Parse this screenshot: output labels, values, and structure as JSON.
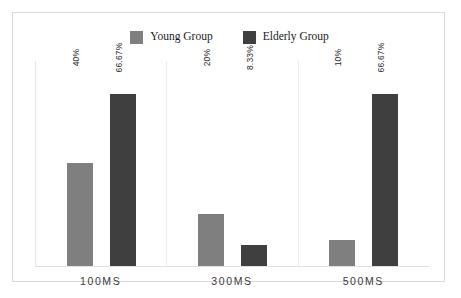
{
  "chart_data": {
    "type": "bar",
    "title": "",
    "subtitle": "",
    "xlabel": "",
    "ylabel": "",
    "categories": [
      "100MS",
      "300MS",
      "500MS"
    ],
    "series": [
      {
        "name": "Young Group",
        "color": "#7f7f7f",
        "values": [
          40,
          20,
          10
        ],
        "labels": [
          "40%",
          "20%",
          "10%"
        ]
      },
      {
        "name": "Elderly Group",
        "color": "#3f3f3f",
        "values": [
          66.67,
          8.33,
          66.67
        ],
        "labels": [
          "66.67%",
          "8.33%",
          "66.67%"
        ]
      }
    ],
    "ylim": [
      0,
      80
    ],
    "grid": false,
    "legend_position": "top-center",
    "value_label_rotation": -90
  },
  "legend": {
    "entries": [
      {
        "label": "Young Group",
        "swatch_color": "#7f7f7f",
        "swatch_name": "legend-swatch-young"
      },
      {
        "label": "Elderly Group",
        "swatch_color": "#3f3f3f",
        "swatch_name": "legend-swatch-elderly"
      }
    ]
  },
  "axis": {
    "ticks": [
      "100MS",
      "300MS",
      "500MS"
    ]
  },
  "colors": {
    "young_group": "#7f7f7f",
    "elderly_group": "#3f3f3f",
    "frame_border": "#d9d9d9",
    "separator": "#ececec",
    "background": "#ffffff",
    "label_text": "#2b2b2b"
  }
}
